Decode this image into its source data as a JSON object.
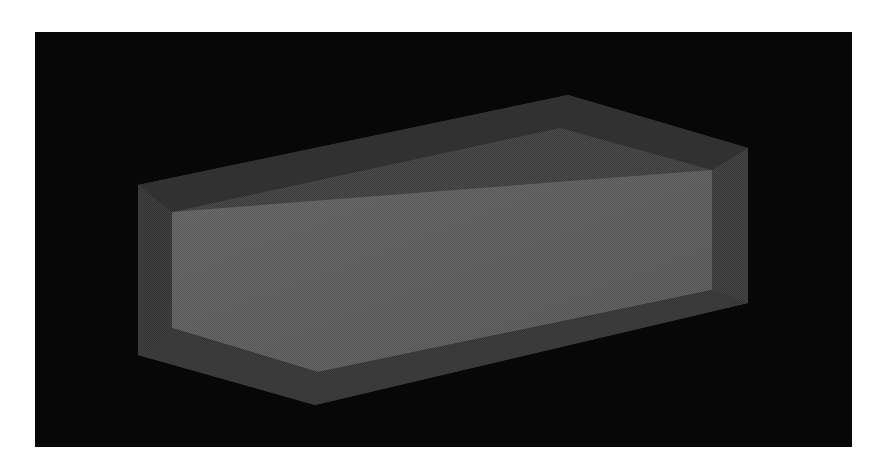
{
  "scene": {
    "description": "3D render of a translucent grey rectangular box containing a lighter inner box, on a black background",
    "colors": {
      "page_background": "#ffffff",
      "render_background": "#070707",
      "outer_top": "#3a3a3a",
      "outer_side": "#454545",
      "outer_bottom_band": "#3e3e3e",
      "inner_front": "#6a6a6a",
      "inner_top": "#505050",
      "inner_right": "#575757"
    },
    "outer_box": {
      "top_face": [
        [
          138,
          185
        ],
        [
          568,
          95
        ],
        [
          748,
          148
        ],
        [
          318,
          240
        ]
      ],
      "front_face": [
        [
          138,
          185
        ],
        [
          318,
          240
        ],
        [
          318,
          405
        ],
        [
          138,
          355
        ]
      ],
      "right_face": [
        [
          318,
          240
        ],
        [
          748,
          148
        ],
        [
          748,
          303
        ],
        [
          318,
          405
        ]
      ]
    },
    "inner_box": {
      "front_face": [
        [
          172,
          212
        ],
        [
          712,
          170
        ],
        [
          712,
          290
        ],
        [
          318,
          372
        ],
        [
          172,
          328
        ]
      ]
    }
  }
}
